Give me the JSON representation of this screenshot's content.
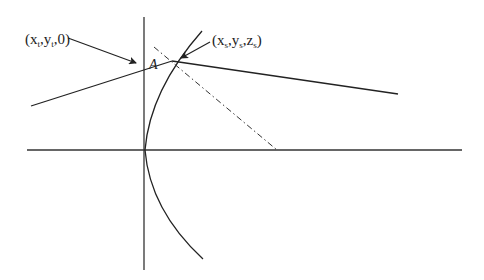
{
  "diagram": {
    "labels": {
      "target_point": "(x",
      "target_sub": "t",
      "target_y": ",y",
      "target_rest": ",0)",
      "source_point": "(x",
      "source_sub": "s",
      "source_y": ",y",
      "source_z": ",z",
      "source_rest": ")",
      "angle": "A"
    },
    "colors": {
      "stroke": "#222222",
      "background": "#ffffff"
    },
    "elements": {
      "horizontal_axis": {
        "x1": 27,
        "y1": 150,
        "x2": 462,
        "y2": 150
      },
      "vertical_axis": {
        "x1": 144,
        "y1": 17,
        "x2": 144,
        "y2": 270
      },
      "curve": {
        "top": [
          202,
          31
        ],
        "vertex": [
          145,
          150
        ],
        "bottom": [
          203,
          259
        ]
      },
      "ray_left": {
        "x1": 31,
        "y1": 106,
        "x2": 172,
        "y2": 61
      },
      "ray_right": {
        "x1": 172,
        "y1": 61,
        "x2": 398,
        "y2": 94
      },
      "normal_dashdot": {
        "x1": 154,
        "y1": 47,
        "x2": 277,
        "y2": 150
      },
      "intersection": [
        172,
        61
      ]
    }
  }
}
